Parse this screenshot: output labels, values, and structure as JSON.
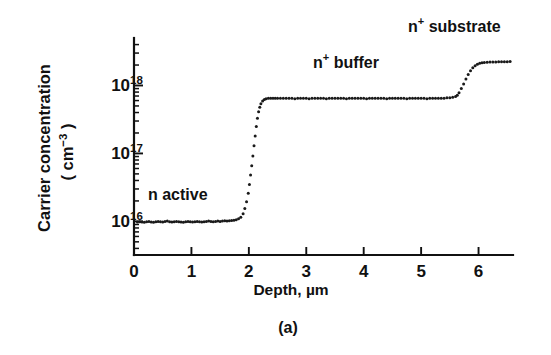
{
  "figure": {
    "caption": "(a)",
    "background": "#ffffff",
    "ink_color": "#111111"
  },
  "chart_data": {
    "type": "scatter",
    "title": "",
    "subtitle": "",
    "xlabel": "Depth, µm",
    "ylabel_line1": "Carrier concentration",
    "ylabel_line2_prefix": "( cm",
    "ylabel_line2_sup": "−3",
    "ylabel_line2_suffix": " )",
    "ylabel_full": "Carrier concentration ( cm−3 )",
    "xlim": [
      0,
      6.6
    ],
    "ylim": [
      3200000000000000.0,
      5e+18
    ],
    "yscale": "log",
    "xscale": "linear",
    "grid": false,
    "legend": false,
    "legend_position": "none",
    "xticks": [
      0,
      1,
      2,
      3,
      4,
      5,
      6
    ],
    "xticklabels": [
      "0",
      "1",
      "2",
      "3",
      "4",
      "5",
      "6"
    ],
    "yticks": [
      1e+16,
      1e+17,
      1e+18
    ],
    "yticklabels_mantissa": [
      "10",
      "10",
      "10"
    ],
    "yticklabels_exponent": [
      "16",
      "17",
      "18"
    ],
    "yticklabels": [
      "10^16",
      "10^17",
      "10^18"
    ],
    "yminorticks": [
      4000000000000000.0,
      5000000000000000.0,
      6000000000000000.0,
      7000000000000000.0,
      8000000000000000.0,
      9000000000000000.0,
      2e+16,
      3e+16,
      4e+16,
      5e+16,
      6e+16,
      7e+16,
      8e+16,
      9e+16,
      2e+17,
      3e+17,
      4e+17,
      5e+17,
      6e+17,
      7e+17,
      8e+17,
      9e+17,
      2e+18,
      3e+18,
      4e+18
    ],
    "series": [
      {
        "name": "carrier concentration profile",
        "marker": "dot",
        "x": [
          0.06,
          0.1,
          0.14,
          0.18,
          0.22,
          0.26,
          0.3,
          0.34,
          0.38,
          0.42,
          0.46,
          0.5,
          0.54,
          0.58,
          0.62,
          0.66,
          0.7,
          0.74,
          0.78,
          0.82,
          0.86,
          0.9,
          0.94,
          0.98,
          1.02,
          1.06,
          1.1,
          1.14,
          1.18,
          1.22,
          1.26,
          1.3,
          1.34,
          1.38,
          1.42,
          1.46,
          1.5,
          1.54,
          1.58,
          1.62,
          1.66,
          1.7,
          1.74,
          1.78,
          1.82,
          1.86,
          1.9,
          1.93,
          1.96,
          1.99,
          2.01,
          2.03,
          2.05,
          2.07,
          2.09,
          2.11,
          2.13,
          2.15,
          2.17,
          2.19,
          2.21,
          2.24,
          2.27,
          2.3,
          2.34,
          2.38,
          2.42,
          2.46,
          2.5,
          2.55,
          2.6,
          2.65,
          2.7,
          2.75,
          2.8,
          2.85,
          2.9,
          2.95,
          3.0,
          3.05,
          3.1,
          3.15,
          3.2,
          3.25,
          3.3,
          3.35,
          3.4,
          3.45,
          3.5,
          3.55,
          3.6,
          3.65,
          3.7,
          3.75,
          3.8,
          3.85,
          3.9,
          3.95,
          4.0,
          4.05,
          4.1,
          4.15,
          4.2,
          4.25,
          4.3,
          4.35,
          4.4,
          4.45,
          4.5,
          4.55,
          4.6,
          4.65,
          4.7,
          4.75,
          4.8,
          4.85,
          4.9,
          4.95,
          5.0,
          5.05,
          5.1,
          5.15,
          5.2,
          5.25,
          5.3,
          5.35,
          5.4,
          5.45,
          5.5,
          5.55,
          5.6,
          5.63,
          5.66,
          5.7,
          5.74,
          5.78,
          5.82,
          5.86,
          5.9,
          5.94,
          5.98,
          6.02,
          6.06,
          6.1,
          6.15,
          6.2,
          6.25,
          6.3,
          6.35,
          6.4,
          6.45,
          6.5,
          6.55
        ],
        "y": [
          9800000000000000.0,
          9900000000000000.0,
          9800000000000000.0,
          9700000000000000.0,
          9900000000000000.0,
          1e+16,
          9800000000000000.0,
          9700000000000000.0,
          9900000000000000.0,
          1e+16,
          9900000000000000.0,
          9800000000000000.0,
          1e+16,
          1.01e+16,
          9900000000000000.0,
          9800000000000000.0,
          9900000000000000.0,
          1e+16,
          9900000000000000.0,
          9800000000000000.0,
          9700000000000000.0,
          9900000000000000.0,
          1e+16,
          9900000000000000.0,
          9800000000000000.0,
          9900000000000000.0,
          1e+16,
          9900000000000000.0,
          9800000000000000.0,
          9900000000000000.0,
          1e+16,
          1.01e+16,
          1e+16,
          9900000000000000.0,
          1e+16,
          1.01e+16,
          1e+16,
          1.01e+16,
          1.02e+16,
          1.01e+16,
          1.02e+16,
          1.03e+16,
          1.04e+16,
          1.06e+16,
          1.09e+16,
          1.15e+16,
          1.3e+16,
          1.55e+16,
          1.95e+16,
          2.6e+16,
          3.5e+16,
          4.8e+16,
          6.6e+16,
          9.2e+16,
          1.3e+17,
          1.8e+17,
          2.5e+17,
          3.3e+17,
          4.1e+17,
          4.8e+17,
          5.4e+17,
          5.9e+17,
          6.2e+17,
          6.4e+17,
          6.5e+17,
          6.5e+17,
          6.5e+17,
          6.5e+17,
          6.5e+17,
          6.5e+17,
          6.5e+17,
          6.5e+17,
          6.5e+17,
          6.5e+17,
          6.4e+17,
          6.5e+17,
          6.5e+17,
          6.5e+17,
          6.5e+17,
          6.4e+17,
          6.5e+17,
          6.5e+17,
          6.5e+17,
          6.5e+17,
          6.5e+17,
          6.4e+17,
          6.5e+17,
          6.5e+17,
          6.5e+17,
          6.5e+17,
          6.5e+17,
          6.5e+17,
          6.4e+17,
          6.5e+17,
          6.5e+17,
          6.5e+17,
          6.5e+17,
          6.5e+17,
          6.5e+17,
          6.4e+17,
          6.5e+17,
          6.5e+17,
          6.5e+17,
          6.5e+17,
          6.5e+17,
          6.5e+17,
          6.4e+17,
          6.5e+17,
          6.5e+17,
          6.5e+17,
          6.5e+17,
          6.5e+17,
          6.5e+17,
          6.4e+17,
          6.5e+17,
          6.5e+17,
          6.5e+17,
          6.5e+17,
          6.5e+17,
          6.5e+17,
          6.4e+17,
          6.5e+17,
          6.5e+17,
          6.5e+17,
          6.5e+17,
          6.5e+17,
          6.5e+17,
          6.6e+17,
          6.6e+17,
          6.7e+17,
          6.9e+17,
          7.2e+17,
          7.8e+17,
          9e+17,
          1.05e+18,
          1.25e+18,
          1.45e+18,
          1.65e+18,
          1.82e+18,
          1.95e+18,
          2.05e+18,
          2.12e+18,
          2.16e+18,
          2.18e+18,
          2.2e+18,
          2.21e+18,
          2.22e+18,
          2.22e+18,
          2.23e+18,
          2.23e+18,
          2.24e+18,
          2.24e+18,
          2.25e+18
        ]
      }
    ],
    "annotations": [
      {
        "id": "n-active",
        "text_prefix": "n active",
        "superscript": "",
        "text_suffix": "",
        "full_text": "n active",
        "x_px": 148,
        "y_px": 200,
        "region_depth_range": [
          0.0,
          1.9
        ],
        "region_level": 1e+16
      },
      {
        "id": "n-plus-buffer",
        "text_prefix": "n",
        "superscript": "+",
        "text_suffix": " buffer",
        "full_text": "n+ buffer",
        "x_px": 313,
        "y_px": 68,
        "region_depth_range": [
          2.2,
          5.6
        ],
        "region_level": 6.5e+17
      },
      {
        "id": "n-plus-substrate",
        "text_prefix": "n",
        "superscript": "+",
        "text_suffix": " substrate",
        "full_text": "n+ substrate",
        "x_px": 408,
        "y_px": 32,
        "region_depth_range": [
          6.0,
          6.6
        ],
        "region_level": 2.25e+18
      }
    ]
  }
}
